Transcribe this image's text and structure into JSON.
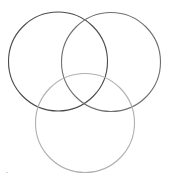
{
  "diagram": {
    "type": "venn",
    "canvas": {
      "width": 169,
      "height": 178,
      "background": "#ffffff"
    },
    "circles": [
      {
        "name": "left",
        "cx": 58,
        "cy": 61.5,
        "r": 49.5,
        "stroke": "#4a4a4a",
        "stroke_width": 1.1
      },
      {
        "name": "right",
        "cx": 111,
        "cy": 62,
        "r": 49.5,
        "stroke": "#707070",
        "stroke_width": 1.1
      },
      {
        "name": "bottom",
        "cx": 85,
        "cy": 123,
        "r": 49.5,
        "stroke": "#b0b0b0",
        "stroke_width": 1.1
      }
    ],
    "artifact": {
      "x": 6,
      "y": 172,
      "w": 2,
      "h": 1,
      "color": "#d8d8d8"
    }
  }
}
